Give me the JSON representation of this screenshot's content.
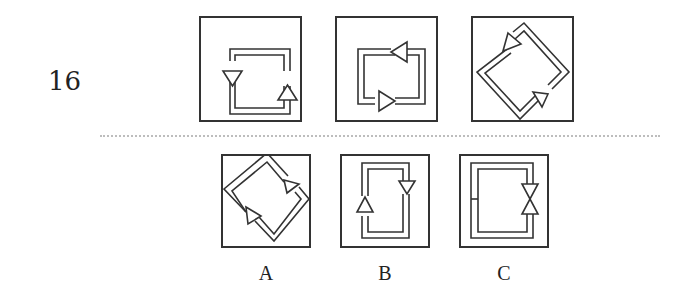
{
  "question": {
    "number": "16"
  },
  "stem_figures": [
    {
      "id": "figure-1",
      "shape": "square",
      "arrows": "left side down, right side up"
    },
    {
      "id": "figure-2",
      "shape": "square",
      "arrows": "top side left, bottom side right"
    },
    {
      "id": "figure-3",
      "shape": "diamond",
      "arrows": "upper-left edge down-left, lower-right edge up-right"
    }
  ],
  "options": [
    {
      "label": "A",
      "shape": "diamond"
    },
    {
      "label": "B",
      "shape": "square"
    },
    {
      "label": "C",
      "shape": "square"
    }
  ],
  "colors": {
    "stroke": "#333333",
    "divider": "#bdbdbd",
    "text": "#222222"
  }
}
